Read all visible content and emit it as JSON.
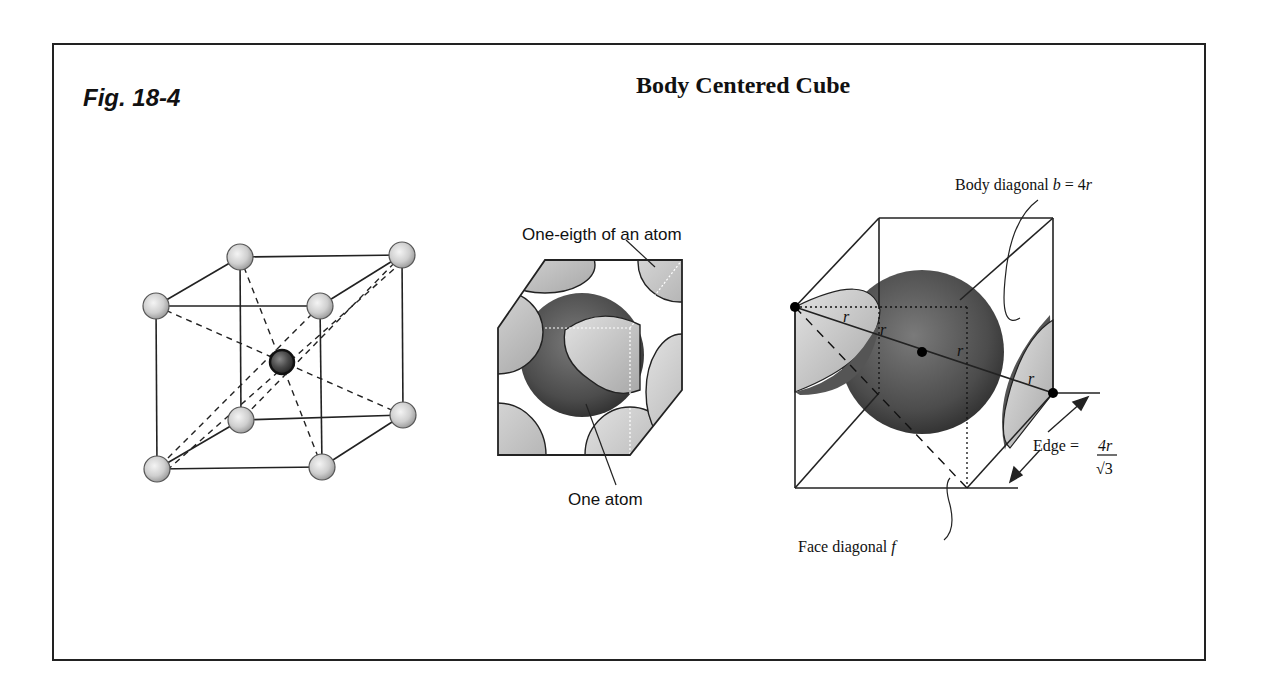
{
  "figure": {
    "label": "Fig. 18-4",
    "title": "Body Centered Cube"
  },
  "diagram_1": {
    "name": "bcc-lattice-ball-and-stick",
    "corner_atoms": 8,
    "center_atoms": 1
  },
  "diagram_2": {
    "name": "bcc-space-filling-model",
    "labels": {
      "corner": "One-eigth of an atom",
      "center": "One atom"
    }
  },
  "diagram_3": {
    "name": "bcc-geometry",
    "labels": {
      "body_diagonal_prefix": "Body diagonal ",
      "body_diagonal_var": "b",
      "body_diagonal_eq": " = 4",
      "body_diagonal_r": "r",
      "face_diagonal_prefix": "Face diagonal ",
      "face_diagonal_var": "f",
      "edge_prefix": "Edge = ",
      "edge_numerator": "4r",
      "edge_denominator": "√3",
      "radius": "r"
    }
  },
  "colors": {
    "line": "#222222",
    "atom_light": "#d4d4d4",
    "atom_dark": "#3a3a3a",
    "frame": "#222222"
  }
}
